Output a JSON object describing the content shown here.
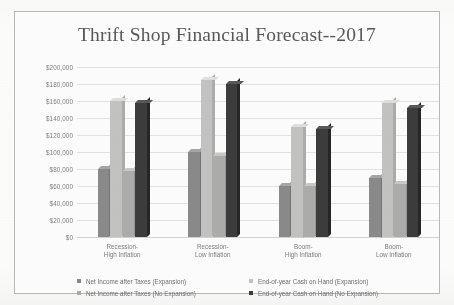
{
  "chart_data": {
    "type": "bar",
    "title": "Thrift Shop Financial Forecast--2017",
    "xlabel": "",
    "ylabel": "",
    "ylim": [
      0,
      200000
    ],
    "ytick_step": 20000,
    "grid": true,
    "legend_position": "bottom",
    "tick_labels": [
      "$0",
      "$20,000",
      "$40,000",
      "$60,000",
      "$80,000",
      "$100,000",
      "$120,000",
      "$140,000",
      "$160,000",
      "$180,000",
      "$200,000"
    ],
    "categories": [
      "Recession-\nHigh Inflation",
      "Recession-\nLow Inflation",
      "Boom-\nHigh Inflation",
      "Boom-\nLow Inflation"
    ],
    "categories_flat": [
      "Recession-High Inflation",
      "Recession-Low Inflation",
      "Boom-High Inflation",
      "Boom-Low Inflation"
    ],
    "series": [
      {
        "name": "Net Income after Taxes (Expansion)",
        "color": "#8a8a8a",
        "values": [
          80000,
          100000,
          60000,
          70000
        ]
      },
      {
        "name": "End-of-year Cash on Hand (Expansion)",
        "color": "#c3c3c1",
        "values": [
          160000,
          185000,
          130000,
          158000
        ]
      },
      {
        "name": "Net Income after Taxes (No Expansion)",
        "color": "#adadab",
        "values": [
          78000,
          95000,
          60000,
          62000
        ]
      },
      {
        "name": "End-of-year Cash on Hand (No Expansion)",
        "color": "#3c3c3c",
        "values": [
          158000,
          180000,
          127000,
          152000
        ]
      }
    ]
  },
  "legend": {
    "entries": [
      "Net Income after Taxes (Expansion)",
      "End-of-year Cash on Hand (Expansion)",
      "Net Income after Taxes (No Expansion)",
      "End-of-year Cash on Hand (No Expansion)"
    ]
  }
}
